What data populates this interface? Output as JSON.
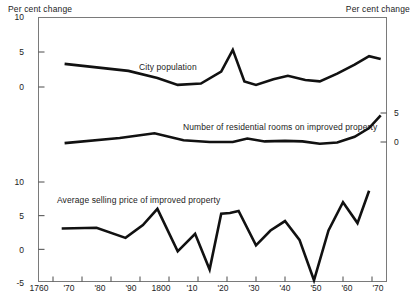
{
  "chart_data": {
    "type": "line",
    "title": "",
    "xlabel": "",
    "ylabel": "Per cent change",
    "ylabel_right": "Per cent change",
    "grid": false,
    "legend": "inline-labels",
    "x_ticks": [
      "1760",
      "'70",
      "'80",
      "'90",
      "1800",
      "'10",
      "'20",
      "'30",
      "'40",
      "'50",
      "'60",
      "'70"
    ],
    "x_values": [
      1760,
      1770,
      1780,
      1790,
      1800,
      1810,
      1820,
      1830,
      1840,
      1850,
      1860,
      1870
    ],
    "xlim": [
      1755,
      1875
    ],
    "panels": [
      {
        "name": "city-population",
        "label": "City population",
        "axis_side": "left",
        "y_ticks": [
          10,
          5,
          0
        ],
        "ylim": [
          -2,
          10
        ],
        "series": [
          {
            "name": "City population",
            "x": [
              1764,
              1786,
              1796,
              1803,
              1811,
              1818,
              1822,
              1826,
              1830,
              1836,
              1841,
              1847,
              1852,
              1858,
              1864,
              1869,
              1873
            ],
            "values": [
              3.3,
              2.3,
              1.3,
              0.3,
              0.5,
              2.2,
              5.3,
              0.8,
              0.3,
              1.1,
              1.6,
              1.0,
              0.8,
              1.9,
              3.2,
              4.4,
              4.0
            ]
          }
        ]
      },
      {
        "name": "residential-rooms",
        "label": "Number of residential rooms on improved property",
        "axis_side": "right",
        "y_ticks": [
          5,
          0
        ],
        "ylim": [
          -2,
          7
        ],
        "series": [
          {
            "name": "Number of residential rooms on improved property",
            "x": [
              1764,
              1783,
              1795,
              1805,
              1814,
              1822,
              1827,
              1833,
              1840,
              1846,
              1852,
              1858,
              1864,
              1869,
              1873
            ],
            "values": [
              -0.2,
              0.7,
              1.5,
              0.3,
              0.0,
              0.0,
              0.6,
              0.1,
              0.2,
              0.1,
              -0.3,
              -0.1,
              0.9,
              2.4,
              4.6
            ]
          }
        ]
      },
      {
        "name": "selling-price",
        "label": "Average selling price of improved property",
        "axis_side": "left",
        "y_ticks": [
          10,
          5,
          0,
          -5
        ],
        "ylim": [
          -5,
          13
        ],
        "series": [
          {
            "name": "Average selling price of improved property",
            "x": [
              1763,
              1775,
              1785,
              1791,
              1796,
              1803,
              1809,
              1814,
              1818,
              1821,
              1824,
              1830,
              1835,
              1840,
              1845,
              1850,
              1855,
              1860,
              1865,
              1869
            ],
            "values": [
              3.1,
              3.2,
              1.7,
              3.6,
              6.0,
              -0.3,
              2.3,
              -3.0,
              5.3,
              5.4,
              5.7,
              0.6,
              2.8,
              4.2,
              1.4,
              -4.6,
              2.8,
              7.0,
              3.9,
              8.7
            ]
          }
        ]
      }
    ]
  },
  "annotations": {
    "city_population": "City population",
    "residential_rooms": "Number of residential rooms on improved property",
    "selling_price": "Average selling price of improved property"
  }
}
